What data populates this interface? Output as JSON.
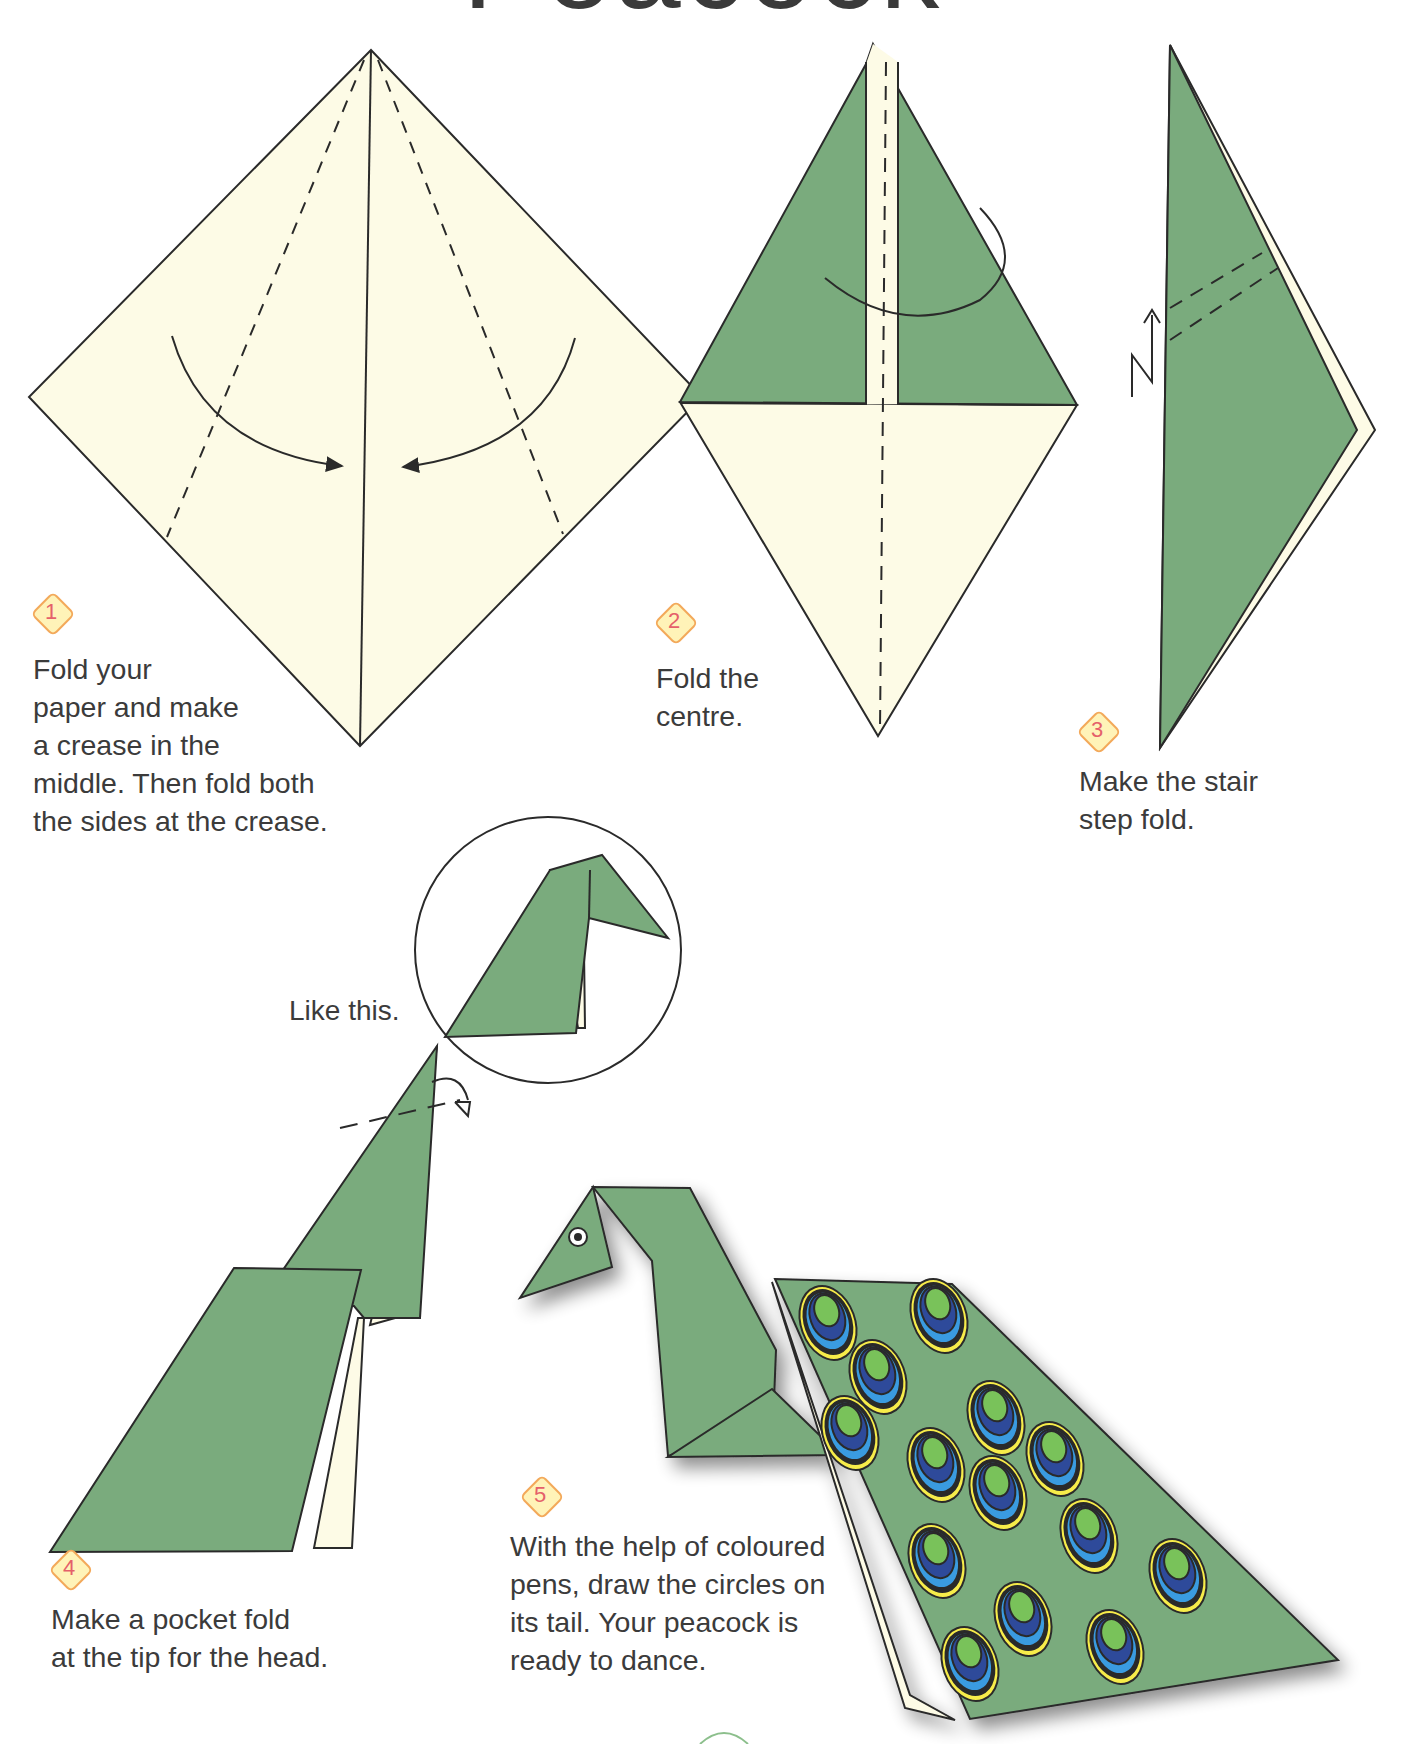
{
  "page": {
    "title": "Peacock",
    "colors": {
      "paper_green": "#7aab7d",
      "paper_cream": "#fdfbe6",
      "outline": "#2a2a2a",
      "badge_fill": "#fff3b8",
      "badge_border": "#f3a95a",
      "badge_number": "#e5606a",
      "feather_green": "#79c25a",
      "feather_navy": "#2e4a9a",
      "feather_blue": "#3a9be0",
      "feather_yellow": "#f7ec4a"
    }
  },
  "steps": [
    {
      "number": "1",
      "text": "Fold your\npaper and make\na crease in the\nmiddle. Then fold both\nthe sides at the crease."
    },
    {
      "number": "2",
      "text": "Fold the\ncentre."
    },
    {
      "number": "3",
      "text": "Make the stair\nstep fold."
    },
    {
      "number": "4",
      "text": "Make a pocket fold\nat the tip for the head.",
      "callout": "Like this."
    },
    {
      "number": "5",
      "text": "With the help of coloured\npens, draw the circles on\nits tail. Your peacock is\nready to dance.",
      "feather_count": 14
    }
  ]
}
